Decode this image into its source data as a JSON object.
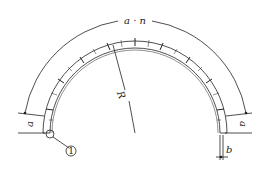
{
  "diagram": {
    "labels": {
      "arc_length": "a · n",
      "radius": "R",
      "segment_left": "a",
      "segment_right": "a",
      "thickness": "b",
      "callout": "1"
    },
    "colors": {
      "stroke": "#222222",
      "background": "#ffffff"
    },
    "geometry": {
      "segments": 12
    }
  }
}
